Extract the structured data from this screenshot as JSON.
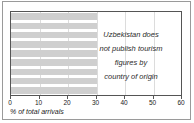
{
  "chart_data": {
    "type": "bar",
    "orientation": "horizontal",
    "title": "",
    "xlabel": "% of total arrivals",
    "ylabel": "",
    "xlim": [
      0,
      60
    ],
    "xticks": [
      0,
      10,
      20,
      30,
      40,
      50,
      60
    ],
    "xtick_labels": [
      "0",
      "10",
      "20",
      "30",
      "40",
      "50",
      "60"
    ],
    "grid": true,
    "legend": null,
    "categories": [
      "",
      "",
      "",
      "",
      "",
      "",
      "",
      "",
      ""
    ],
    "values": [
      30,
      30,
      30,
      30,
      30,
      30,
      30,
      30,
      30
    ],
    "bar_color": "#cfcfcf",
    "annotation_lines": [
      "Uzbekistan does",
      "not publish tourism",
      "figures by",
      "country of origin"
    ],
    "annotation_text": "Uzbekistan does not publish tourism figures by country of origin"
  },
  "colors": {
    "bar": "#cfcfcf",
    "grid": "#dcdcdc",
    "axis": "#555555",
    "frame": "#9a9a9a",
    "text": "#1a1a1a"
  }
}
